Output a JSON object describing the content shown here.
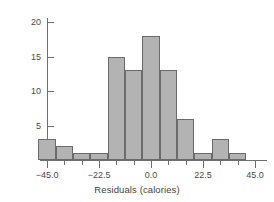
{
  "chart_data": {
    "type": "bar",
    "title": "",
    "subtitle": "",
    "xlabel": "Residuals (calories)",
    "ylabel": "",
    "bin_width": 7.5,
    "bin_starts": [
      -48.75,
      -41.25,
      -33.75,
      -26.25,
      -18.75,
      -11.25,
      -3.75,
      3.75,
      11.25,
      18.75,
      26.25,
      33.75
    ],
    "categories": [
      "-48.75 to -41.25",
      "-41.25 to -33.75",
      "-33.75 to -26.25",
      "-26.25 to -18.75",
      "-18.75 to -11.25",
      "-11.25 to -3.75",
      "-3.75 to 3.75",
      "3.75 to 11.25",
      "11.25 to 18.75",
      "18.75 to 26.25",
      "26.25 to 33.75",
      "33.75 to 41.25"
    ],
    "values": [
      3,
      2,
      1,
      1,
      15,
      13,
      18,
      13,
      6,
      1,
      3,
      1
    ],
    "xlim": [
      -52.5,
      52.5
    ],
    "ylim": [
      0,
      21
    ],
    "grid": false,
    "legend": false,
    "bar_color": "#b3b3b3",
    "bar_border_color": "#6b6b6b",
    "axis_color": "#6e6e6e",
    "text_color": "#4a4a4a",
    "background_color": "#ffffff",
    "y_ticks": [
      {
        "value": 20,
        "label": "20"
      },
      {
        "value": 15,
        "label": "15"
      },
      {
        "value": 10,
        "label": "10"
      },
      {
        "value": 5,
        "label": "5"
      }
    ],
    "x_major_ticks": [
      {
        "value": -45.0,
        "label": "-45.0"
      },
      {
        "value": -22.5,
        "label": "-22.5"
      },
      {
        "value": 0.0,
        "label": "0.0"
      },
      {
        "value": 22.5,
        "label": "22.5"
      },
      {
        "value": 45.0,
        "label": "45.0"
      }
    ],
    "x_minor_ticks": [
      -37.5,
      -30.0,
      -15.0,
      -7.5,
      7.5,
      15.0,
      30.0,
      37.5
    ]
  }
}
